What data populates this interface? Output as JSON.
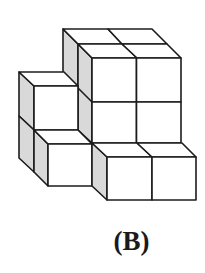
{
  "figure": {
    "type": "isometric-cube-stack",
    "option_label": "(B)",
    "colors": {
      "edge": "#1c1c1c",
      "front_face": "#ffffff",
      "top_face": "#ffffff",
      "shaded_side": "#d9d9d9",
      "background": "#ffffff"
    }
  }
}
